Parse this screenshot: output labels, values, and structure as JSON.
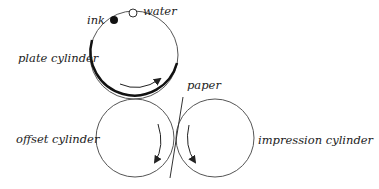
{
  "diagram": {
    "labels": {
      "ink": "ink",
      "water": "water",
      "plate": "plate cylinder",
      "paper": "paper",
      "offset": "offset cylinder",
      "impression": "impression cylinder"
    },
    "colors": {
      "stroke": "#555555",
      "thick": "#111111",
      "text": "#222222"
    }
  }
}
